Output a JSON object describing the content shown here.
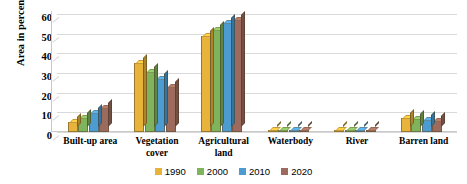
{
  "chart_data": {
    "type": "bar",
    "title": "",
    "subtitle": "",
    "xlabel": "",
    "ylabel": "Area in percentage",
    "ylim": [
      0,
      60
    ],
    "ytick_step": 10,
    "yticks": [
      "60",
      "50",
      "40",
      "30",
      "20",
      "10",
      "0"
    ],
    "grid": true,
    "legend_position": "bottom-center",
    "style": "3d-clustered-column",
    "categories": [
      "Built-up area",
      "Vegetation cover",
      "Agricultural land",
      "Waterbody",
      "River",
      "Barren land"
    ],
    "category_lines": [
      [
        "Built-up area"
      ],
      [
        "Vegetation",
        "cover"
      ],
      [
        "Agricultural",
        "land"
      ],
      [
        "Waterbody"
      ],
      [
        "River"
      ],
      [
        "Barren land"
      ]
    ],
    "series": [
      {
        "name": "1990",
        "color": "#E8B33A",
        "values": [
          5,
          35,
          49,
          1.2,
          1.2,
          7
        ]
      },
      {
        "name": "2000",
        "color": "#7FB35C",
        "values": [
          7,
          30.5,
          52,
          1.2,
          1.2,
          6.5
        ]
      },
      {
        "name": "2010",
        "color": "#4C9BD1",
        "values": [
          9.5,
          27,
          55.5,
          1.2,
          1.2,
          6
        ]
      },
      {
        "name": "2020",
        "color": "#9C6B5E",
        "values": [
          12,
          23,
          57,
          1.2,
          1.2,
          5.5
        ]
      }
    ]
  },
  "colors": {
    "gridline": "#d9d9d9",
    "axis": "#c9c9c9",
    "text": "#000000",
    "background": "#ffffff"
  }
}
